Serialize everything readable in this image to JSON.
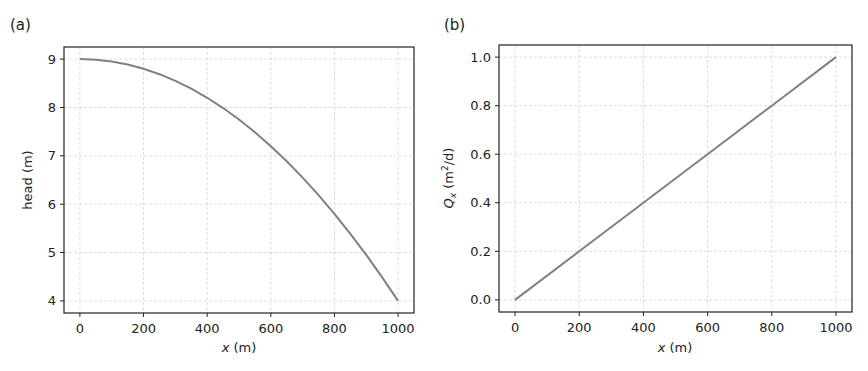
{
  "chart_data": [
    {
      "panel_label": "(a)",
      "type": "line",
      "title": "",
      "xlabel_var": "x",
      "xlabel_unit": " (m)",
      "ylabel": "head (m)",
      "xlim": [
        -50,
        1050
      ],
      "ylim": [
        3.75,
        9.25
      ],
      "xticks": [
        0,
        200,
        400,
        600,
        800,
        1000
      ],
      "xtick_labels": [
        "0",
        "200",
        "400",
        "600",
        "800",
        "1000"
      ],
      "yticks": [
        4,
        5,
        6,
        7,
        8,
        9
      ],
      "ytick_labels": [
        "4",
        "5",
        "6",
        "7",
        "8",
        "9"
      ],
      "grid": true,
      "line_color": "#808080",
      "series": [
        {
          "name": "head",
          "x": [
            0,
            50,
            100,
            150,
            200,
            250,
            300,
            350,
            400,
            450,
            500,
            550,
            600,
            650,
            700,
            750,
            800,
            850,
            900,
            950,
            1000
          ],
          "y": [
            9.0,
            8.9875,
            8.95,
            8.8875,
            8.8,
            8.6875,
            8.55,
            8.3875,
            8.2,
            7.9875,
            7.75,
            7.4875,
            7.2,
            6.8875,
            6.55,
            6.1875,
            5.8,
            5.3875,
            4.95,
            4.4875,
            4.0
          ]
        }
      ]
    },
    {
      "panel_label": "(b)",
      "type": "line",
      "title": "",
      "xlabel_var": "x",
      "xlabel_unit": " (m)",
      "ylabel_var": "Q",
      "ylabel_sub": "x",
      "ylabel_unit_pre": " (m",
      "ylabel_sup": "2",
      "ylabel_unit_post": "/d)",
      "xlim": [
        -50,
        1050
      ],
      "ylim": [
        -0.05,
        1.05
      ],
      "xticks": [
        0,
        200,
        400,
        600,
        800,
        1000
      ],
      "xtick_labels": [
        "0",
        "200",
        "400",
        "600",
        "800",
        "1000"
      ],
      "yticks": [
        0.0,
        0.2,
        0.4,
        0.6,
        0.8,
        1.0
      ],
      "ytick_labels": [
        "0.0",
        "0.2",
        "0.4",
        "0.6",
        "0.8",
        "1.0"
      ],
      "grid": true,
      "line_color": "#808080",
      "series": [
        {
          "name": "Qx",
          "x": [
            0,
            200,
            400,
            600,
            800,
            1000
          ],
          "y": [
            0.0,
            0.2,
            0.4,
            0.6,
            0.8,
            1.0
          ]
        }
      ]
    }
  ]
}
